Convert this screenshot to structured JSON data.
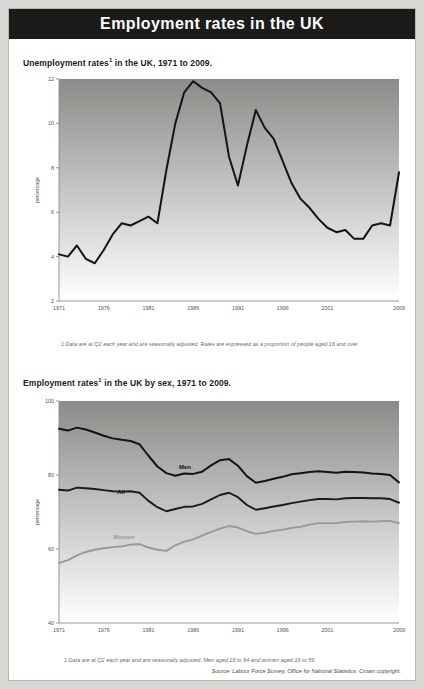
{
  "header": {
    "title": "Employment rates in the UK"
  },
  "chart1": {
    "title": "Unemployment rates",
    "title_sup": "1",
    "title_rest": " in the UK, 1971 to 2009.",
    "axis_name": "percentage",
    "footnote": "1 Data are at Q2 each year and are seasonally adjusted. Rates are expressed as a proportion of people aged 16 and over."
  },
  "chart2": {
    "title": "Employment rates",
    "title_sup": "1",
    "title_rest": " in the UK by sex, 1971 to 2009.",
    "axis_name": "percentage",
    "footnote": "1 Data are at Q2 each year and are seasonally adjusted. Men aged 16 to 64 and women aged 16 to 59."
  },
  "source": "Source: Labour Force Survey, Office for National Statistics. Crown copyright.",
  "chart_data": [
    {
      "type": "line",
      "title": "Unemployment rates in the UK, 1971 to 2009",
      "xlabel": "",
      "ylabel": "percentage",
      "xlim": [
        1971,
        2009
      ],
      "ylim": [
        2,
        12
      ],
      "yticks": [
        2,
        4,
        6,
        8,
        10,
        12
      ],
      "xticks": [
        1971,
        1976,
        1981,
        1986,
        1991,
        1996,
        2001,
        2009
      ],
      "grid": false,
      "legend": "none",
      "x": [
        1971,
        1972,
        1973,
        1974,
        1975,
        1976,
        1977,
        1978,
        1979,
        1980,
        1981,
        1982,
        1983,
        1984,
        1985,
        1986,
        1987,
        1988,
        1989,
        1990,
        1991,
        1992,
        1993,
        1994,
        1995,
        1996,
        1997,
        1998,
        1999,
        2000,
        2001,
        2002,
        2003,
        2004,
        2005,
        2006,
        2007,
        2008,
        2009
      ],
      "series": [
        {
          "name": "Unemployment rate",
          "color": "#141414",
          "values": [
            4.1,
            4.0,
            4.5,
            3.9,
            3.7,
            4.3,
            5.0,
            5.5,
            5.4,
            5.6,
            5.8,
            5.5,
            7.9,
            10.0,
            11.4,
            11.9,
            11.6,
            11.4,
            10.9,
            8.5,
            7.2,
            9.0,
            10.6,
            9.8,
            9.3,
            8.3,
            7.3,
            6.6,
            6.2,
            5.7,
            5.3,
            5.1,
            5.2,
            4.8,
            4.8,
            5.4,
            5.5,
            5.4,
            7.8
          ]
        }
      ]
    },
    {
      "type": "line",
      "title": "Employment rates in the UK by sex, 1971 to 2009",
      "xlabel": "",
      "ylabel": "percentage",
      "xlim": [
        1971,
        2009
      ],
      "ylim": [
        40,
        100
      ],
      "yticks": [
        40,
        60,
        80,
        100
      ],
      "xticks": [
        1971,
        1976,
        1981,
        1986,
        1991,
        1996,
        2001,
        2009
      ],
      "grid": false,
      "legend": "inline-labels",
      "x": [
        1971,
        1972,
        1973,
        1974,
        1975,
        1976,
        1977,
        1978,
        1979,
        1980,
        1981,
        1982,
        1983,
        1984,
        1985,
        1986,
        1987,
        1988,
        1989,
        1990,
        1991,
        1992,
        1993,
        1994,
        1995,
        1996,
        1997,
        1998,
        1999,
        2000,
        2001,
        2002,
        2003,
        2004,
        2005,
        2006,
        2007,
        2008,
        2009
      ],
      "series": [
        {
          "name": "Men",
          "color": "#141414",
          "values": [
            92.5,
            92.0,
            92.8,
            92.3,
            91.5,
            90.6,
            89.9,
            89.5,
            89.2,
            88.3,
            85.2,
            82.3,
            80.5,
            79.8,
            80.4,
            80.3,
            80.9,
            82.6,
            84.0,
            84.3,
            82.5,
            79.7,
            77.9,
            78.4,
            79.0,
            79.5,
            80.2,
            80.5,
            80.8,
            81.0,
            80.8,
            80.6,
            80.9,
            80.8,
            80.7,
            80.4,
            80.3,
            80.0,
            78.0
          ]
        },
        {
          "name": "All",
          "color": "#1a1a1a",
          "values": [
            76.0,
            75.8,
            76.6,
            76.4,
            76.2,
            75.9,
            75.6,
            75.5,
            75.6,
            75.2,
            73.0,
            71.3,
            70.2,
            70.8,
            71.4,
            71.5,
            72.2,
            73.4,
            74.6,
            75.2,
            74.0,
            71.9,
            70.6,
            71.0,
            71.5,
            71.9,
            72.4,
            72.8,
            73.2,
            73.5,
            73.5,
            73.4,
            73.7,
            73.8,
            73.8,
            73.7,
            73.7,
            73.5,
            72.5
          ]
        },
        {
          "name": "Women",
          "color": "#9b9995",
          "values": [
            56.2,
            57.0,
            58.3,
            59.2,
            59.8,
            60.2,
            60.5,
            60.7,
            61.2,
            61.3,
            60.4,
            59.8,
            59.5,
            61.0,
            62.0,
            62.6,
            63.6,
            64.6,
            65.5,
            66.2,
            65.8,
            64.8,
            64.1,
            64.4,
            64.9,
            65.2,
            65.7,
            66.0,
            66.6,
            67.0,
            67.0,
            67.0,
            67.3,
            67.4,
            67.5,
            67.4,
            67.5,
            67.6,
            67.0
          ]
        }
      ]
    }
  ]
}
